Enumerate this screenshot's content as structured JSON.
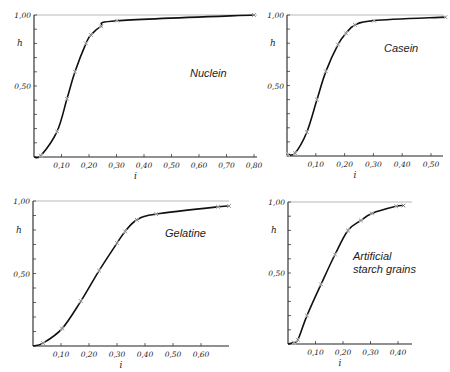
{
  "chart_data": [
    {
      "type": "line",
      "title": "Nuclein",
      "xlabel": "i",
      "ylabel": "h",
      "xlim": [
        0,
        0.8
      ],
      "ylim": [
        0,
        1.0
      ],
      "x_ticks": [
        "0,10",
        "0,20",
        "0,30",
        "0,40",
        "0,50",
        "0,60",
        "0,70",
        "0,80"
      ],
      "y_ticks": [
        "0,50",
        "1,00"
      ],
      "grid": false,
      "series": [
        {
          "name": "Nuclein",
          "x": [
            0.025,
            0.084,
            0.12,
            0.149,
            0.189,
            0.207,
            0.244,
            0.302,
            0.8
          ],
          "values": [
            0.01,
            0.18,
            0.41,
            0.6,
            0.8,
            0.86,
            0.92,
            0.96,
            1.0
          ]
        }
      ],
      "frame": {
        "x0": 34,
        "y0": 157,
        "px_per_unit_x": 275,
        "px_per_unit_y": 142,
        "x_end": 257,
        "label_x": 190,
        "label_y": 77
      }
    },
    {
      "type": "line",
      "title": "Casein",
      "xlabel": "i",
      "ylabel": "h",
      "xlim": [
        0,
        0.55
      ],
      "ylim": [
        0,
        1.0
      ],
      "x_ticks": [
        "0,10",
        "0,20",
        "0,30",
        "0,40",
        "0,50"
      ],
      "y_ticks": [
        "0,50",
        "1,00"
      ],
      "grid": false,
      "series": [
        {
          "name": "Casein",
          "x": [
            0.003,
            0.028,
            0.069,
            0.104,
            0.135,
            0.177,
            0.205,
            0.236,
            0.302,
            0.55
          ],
          "values": [
            0.01,
            0.02,
            0.17,
            0.4,
            0.6,
            0.79,
            0.87,
            0.93,
            0.96,
            0.985
          ]
        }
      ],
      "frame": {
        "x0": 287,
        "y0": 156,
        "px_per_unit_x": 288,
        "px_per_unit_y": 141,
        "x_end": 443,
        "label_x": 384,
        "label_y": 52
      }
    },
    {
      "type": "line",
      "title": "Gelatine",
      "xlabel": "i",
      "ylabel": "h",
      "xlim": [
        0,
        0.7
      ],
      "ylim": [
        0,
        1.0
      ],
      "x_ticks": [
        "0,10",
        "0,20",
        "0,30",
        "0,40",
        "0,50",
        "0,60"
      ],
      "y_ticks": [
        "0,50",
        "1,00"
      ],
      "grid": false,
      "series": [
        {
          "name": "Gelatine",
          "x": [
            0.036,
            0.104,
            0.171,
            0.236,
            0.3,
            0.329,
            0.371,
            0.44,
            0.661,
            0.7
          ],
          "values": [
            0.02,
            0.12,
            0.31,
            0.52,
            0.71,
            0.79,
            0.87,
            0.91,
            0.96,
            0.965
          ]
        }
      ],
      "frame": {
        "x0": 33,
        "y0": 346,
        "px_per_unit_x": 280,
        "px_per_unit_y": 145,
        "x_end": 229,
        "label_x": 165,
        "label_y": 237
      }
    },
    {
      "type": "line",
      "title": "Artificial starch grains",
      "xlabel": "i",
      "ylabel": "h",
      "xlim": [
        0,
        0.45
      ],
      "ylim": [
        0,
        1.0
      ],
      "x_ticks": [
        "0,10",
        "0,20",
        "0,30",
        "0,40"
      ],
      "y_ticks": [
        "0,50",
        "1,00"
      ],
      "grid": false,
      "series": [
        {
          "name": "Artificial starch grains",
          "x": [
            0.022,
            0.036,
            0.069,
            0.12,
            0.171,
            0.218,
            0.265,
            0.305,
            0.393,
            0.42
          ],
          "values": [
            0.01,
            0.03,
            0.2,
            0.42,
            0.63,
            0.8,
            0.87,
            0.92,
            0.97,
            0.975
          ]
        }
      ],
      "frame": {
        "x0": 288,
        "y0": 344,
        "px_per_unit_x": 275,
        "px_per_unit_y": 142,
        "x_end": 412,
        "label_x": 353,
        "label_y": 260
      }
    }
  ],
  "labels": {
    "chart0_title": "Nuclein",
    "chart1_title": "Casein",
    "chart2_title": "Gelatine",
    "chart3_title_line1": "Artificial",
    "chart3_title_line2": "starch grains",
    "ylabel": "h",
    "xlabel": "i",
    "y_top": "1,00",
    "y_mid": "0,50"
  }
}
